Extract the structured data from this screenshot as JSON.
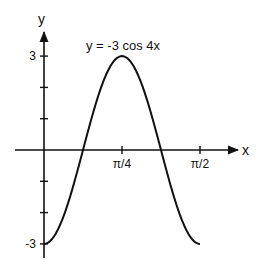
{
  "chart_data": {
    "type": "line",
    "title": "y = -3 cos 4x",
    "xlabel": "x",
    "ylabel": "y",
    "function": "-3*cos(4x)",
    "xlim": [
      0,
      1.5708
    ],
    "ylim": [
      -3,
      3
    ],
    "x_ticks": [
      {
        "value": 0.7854,
        "label": "π/4"
      },
      {
        "value": 1.5708,
        "label": "π/2"
      }
    ],
    "y_ticks": [
      {
        "value": 3,
        "label": "3"
      },
      {
        "value": 2,
        "label": ""
      },
      {
        "value": 1,
        "label": ""
      },
      {
        "value": -1,
        "label": ""
      },
      {
        "value": -2,
        "label": ""
      },
      {
        "value": -3,
        "label": "-3"
      }
    ],
    "series": [
      {
        "name": "y = -3 cos 4x",
        "x": [
          0,
          0.1963,
          0.3927,
          0.589,
          0.7854,
          0.9817,
          1.1781,
          1.3744,
          1.5708
        ],
        "y": [
          -3,
          -2.121,
          0,
          2.121,
          3,
          2.121,
          0,
          -2.121,
          -3
        ]
      }
    ],
    "grid": false,
    "legend": "none"
  }
}
